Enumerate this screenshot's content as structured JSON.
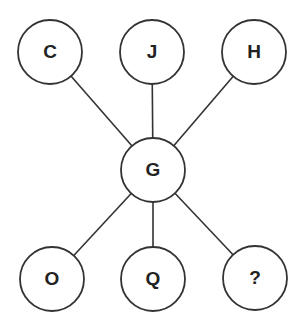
{
  "diagram": {
    "type": "star-puzzle",
    "center": {
      "id": "G",
      "label": "G",
      "cx": 153,
      "cy": 170
    },
    "nodes": [
      {
        "id": "C",
        "label": "C",
        "cx": 50,
        "cy": 52
      },
      {
        "id": "J",
        "label": "J",
        "cx": 152,
        "cy": 52
      },
      {
        "id": "H",
        "label": "H",
        "cx": 254,
        "cy": 52
      },
      {
        "id": "O",
        "label": "O",
        "cx": 52,
        "cy": 279
      },
      {
        "id": "Q",
        "label": "Q",
        "cx": 153,
        "cy": 279
      },
      {
        "id": "unknown",
        "label": "?",
        "cx": 255,
        "cy": 278
      }
    ],
    "edges": [
      [
        "G",
        "C"
      ],
      [
        "G",
        "J"
      ],
      [
        "G",
        "H"
      ],
      [
        "G",
        "O"
      ],
      [
        "G",
        "Q"
      ],
      [
        "G",
        "unknown"
      ]
    ],
    "radius": 32,
    "colors": {
      "stroke": "#333333",
      "fill": "#ffffff",
      "text": "#222222"
    }
  }
}
